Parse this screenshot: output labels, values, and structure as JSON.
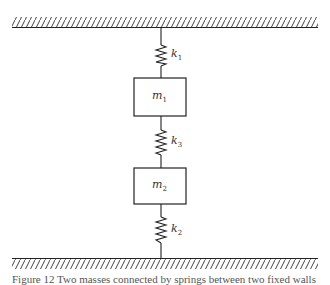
{
  "diagram": {
    "type": "spring-mass system",
    "masses": [
      {
        "id": "m1",
        "symbol": "m",
        "subscript": "1"
      },
      {
        "id": "m2",
        "symbol": "m",
        "subscript": "2"
      }
    ],
    "springs": [
      {
        "id": "k1",
        "symbol": "k",
        "subscript": "1",
        "connects": [
          "top-wall",
          "m1"
        ]
      },
      {
        "id": "k3",
        "symbol": "k",
        "subscript": "3",
        "connects": [
          "m1",
          "m2"
        ]
      },
      {
        "id": "k2",
        "symbol": "k",
        "subscript": "2",
        "connects": [
          "m2",
          "bottom-wall"
        ]
      }
    ],
    "supports": [
      "top-wall",
      "bottom-wall"
    ],
    "caption": "Figure 12 Two masses connected by springs between two fixed walls",
    "colors": {
      "line": "#222222",
      "hatch": "#444444",
      "background": "#ffffff"
    }
  }
}
